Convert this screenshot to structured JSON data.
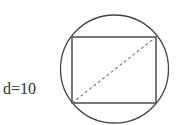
{
  "diagram": {
    "label": "d=10",
    "stroke_color": "#444444",
    "dash_color": "#777777",
    "circle": {
      "cx": 114.5,
      "cy": 69,
      "r": 54
    },
    "rectangle": {
      "x": 72,
      "y": 37,
      "width": 84,
      "height": 66
    },
    "diagonal": {
      "x1": 72,
      "y1": 103,
      "x2": 156,
      "y2": 37,
      "style": "dashed"
    }
  }
}
